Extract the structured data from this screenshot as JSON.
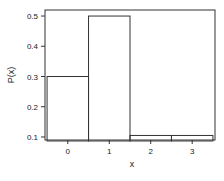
{
  "chart_data": {
    "type": "bar",
    "title": "",
    "xlabel": "x",
    "ylabel": "P(x)",
    "categories": [
      "0",
      "1",
      "2",
      "3"
    ],
    "values": [
      0.3,
      0.5,
      0.105,
      0.105
    ],
    "ylim": [
      0.09,
      0.52
    ],
    "xlim": [
      -0.55,
      3.55
    ],
    "yticks": [
      "0.1",
      "0.2",
      "0.3",
      "0.4",
      "0.5"
    ],
    "xticks": [
      "0",
      "1",
      "2",
      "3"
    ],
    "grid": false,
    "legend": null
  }
}
